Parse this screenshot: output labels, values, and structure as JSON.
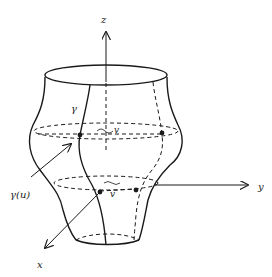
{
  "diagram": {
    "type": "surface-of-revolution",
    "labels": {
      "z_axis": "z",
      "y_axis": "y",
      "x_axis": "x",
      "profile_curve": "γ",
      "profile_point": "γ(u)",
      "angle_upper": "v",
      "angle_lower": "v"
    },
    "colors": {
      "stroke": "#1a1a1a",
      "background": "#ffffff"
    }
  }
}
